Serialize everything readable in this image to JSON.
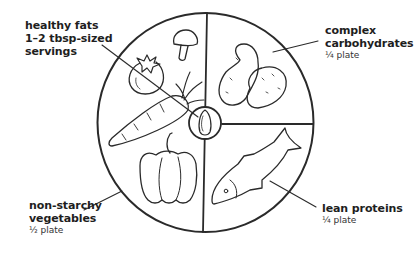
{
  "figure": {
    "type": "plate-method-diagram",
    "colors": {
      "line": "#2a2a2a",
      "text": "#1e1e1e",
      "background": "#ffffff"
    }
  },
  "labels": {
    "fats": {
      "title_line1": "healthy fats",
      "title_line2": "1–2 tbsp-sized",
      "title_line3": "servings"
    },
    "carbs": {
      "title_line1": "complex",
      "title_line2": "carbohydrates",
      "portion": "¼ plate"
    },
    "vegetables": {
      "title_line1": "non-starchy",
      "title_line2": "vegetables",
      "portion": "½ plate"
    },
    "proteins": {
      "title_line1": "lean proteins",
      "portion": "¼ plate"
    }
  },
  "sections": [
    {
      "name": "non-starchy vegetables",
      "portion": "½ plate",
      "illustrations": [
        "tomato",
        "mushroom",
        "carrot",
        "bell pepper"
      ]
    },
    {
      "name": "complex carbohydrates",
      "portion": "¼ plate",
      "illustrations": [
        "potatoes"
      ]
    },
    {
      "name": "lean proteins",
      "portion": "¼ plate",
      "illustrations": [
        "fish"
      ]
    },
    {
      "name": "healthy fats",
      "portion": "1–2 tbsp-sized servings",
      "illustrations": [
        "almond"
      ]
    }
  ]
}
